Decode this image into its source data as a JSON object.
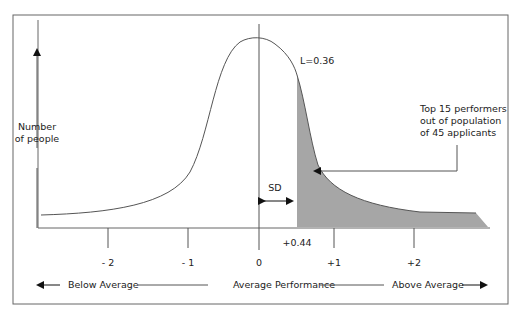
{
  "diagram": {
    "type": "normal-distribution-selection",
    "y_axis_label": [
      "Number",
      "of people"
    ],
    "x_ticks": [
      {
        "label": "- 2",
        "value": -2
      },
      {
        "label": "- 1",
        "value": -1
      },
      {
        "label": "0",
        "value": 0
      },
      {
        "label": "+1",
        "value": 1
      },
      {
        "label": "+2",
        "value": 2
      }
    ],
    "cutoff_label": "+0.44",
    "cutoff_value": 0.44,
    "sd_label": "SD",
    "l_label": "L=0.36",
    "callout": [
      "Top 15 performers",
      "out of population",
      "of 45 applicants"
    ],
    "bottom_scale": {
      "left": "Below Average",
      "center": "Average Performance",
      "right": "Above Average"
    },
    "colors": {
      "line": "#555555",
      "shade": "#a6a6a6",
      "frame": "#666666"
    }
  }
}
